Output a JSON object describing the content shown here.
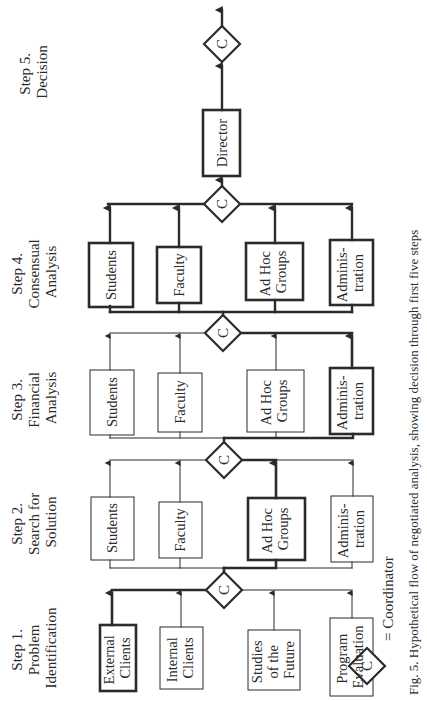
{
  "diagram": {
    "caption": "Fig. 5. Hypothetical flow of negotiated analysis, showing decision through first five steps",
    "legend": {
      "symbol": "C",
      "meaning": "= Coordinator"
    },
    "coordinator_label": "C",
    "steps": [
      {
        "id": "step1",
        "label_lines": [
          "Step 1.",
          "Problem",
          "Identification"
        ],
        "boxes": [
          {
            "lines": [
              "External",
              "Clients"
            ],
            "emphasis": true
          },
          {
            "lines": [
              "Internal",
              "Clients"
            ],
            "emphasis": false
          },
          {
            "lines": [
              "Studies",
              "of the",
              "Future"
            ],
            "emphasis": false
          },
          {
            "lines": [
              "Program",
              "Evaluation"
            ],
            "emphasis": false
          }
        ]
      },
      {
        "id": "step2",
        "label_lines": [
          "Step 2.",
          "Search for",
          "Solution"
        ],
        "boxes": [
          {
            "lines": [
              "Students"
            ],
            "emphasis": false
          },
          {
            "lines": [
              "Faculty"
            ],
            "emphasis": false
          },
          {
            "lines": [
              "Ad Hoc",
              "Groups"
            ],
            "emphasis": true
          },
          {
            "lines": [
              "Adminis-",
              "tration"
            ],
            "emphasis": false
          }
        ]
      },
      {
        "id": "step3",
        "label_lines": [
          "Step 3.",
          "Financial",
          "Analysis"
        ],
        "boxes": [
          {
            "lines": [
              "Students"
            ],
            "emphasis": false
          },
          {
            "lines": [
              "Faculty"
            ],
            "emphasis": false
          },
          {
            "lines": [
              "Ad Hoc",
              "Groups"
            ],
            "emphasis": false
          },
          {
            "lines": [
              "Adminis-",
              "tration"
            ],
            "emphasis": true
          }
        ]
      },
      {
        "id": "step4",
        "label_lines": [
          "Step 4.",
          "Consensual",
          "Analysis"
        ],
        "boxes": [
          {
            "lines": [
              "Students"
            ],
            "emphasis": true
          },
          {
            "lines": [
              "Faculty"
            ],
            "emphasis": true
          },
          {
            "lines": [
              "Ad Hoc",
              "Groups"
            ],
            "emphasis": true
          },
          {
            "lines": [
              "Adminis-",
              "tration"
            ],
            "emphasis": true
          }
        ]
      },
      {
        "id": "step5",
        "label_lines": [
          "Step 5.",
          "Decision"
        ],
        "boxes": [
          {
            "lines": [
              "Director"
            ],
            "emphasis": true
          }
        ]
      }
    ],
    "colors": {
      "ink": "#2b2b2b",
      "background": "#ffffff"
    }
  }
}
